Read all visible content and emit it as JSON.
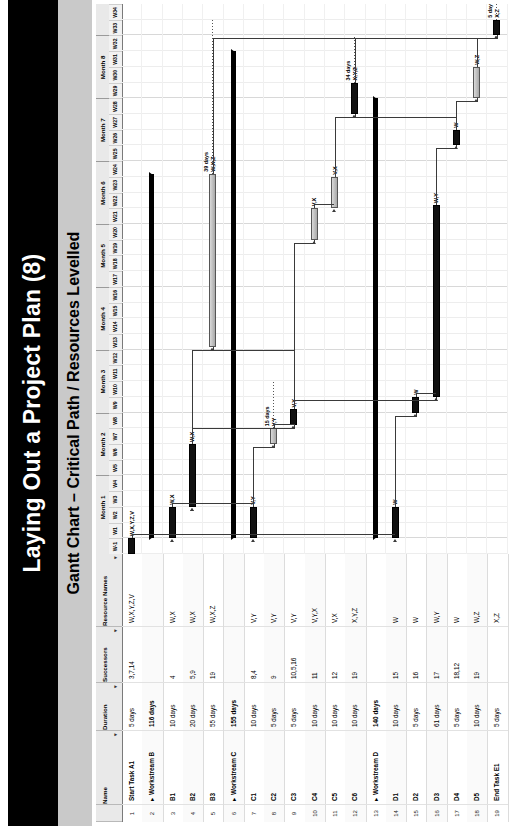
{
  "slide": {
    "title": "Laying Out a Project Plan (8)",
    "subtitle": "Gantt Chart – Critical Path / Resources Levelled"
  },
  "table": {
    "headers": {
      "num": "",
      "name": "Name",
      "duration": "Duration",
      "successors": "Successors",
      "resources": "Resource Names",
      "filter_caret": "▾"
    },
    "rows": [
      {
        "num": "1",
        "name": "Start Task A1",
        "duration": "5 days",
        "successors": "3,7,14",
        "resources": "W,X,Y,Z,V",
        "type": "task"
      },
      {
        "num": "2",
        "name": "Workstream B",
        "duration": "116 days",
        "successors": "",
        "resources": "",
        "type": "summary"
      },
      {
        "num": "3",
        "name": "B1",
        "duration": "10 days",
        "successors": "4",
        "resources": "W,X",
        "type": "task"
      },
      {
        "num": "4",
        "name": "B2",
        "duration": "20 days",
        "successors": "5,9",
        "resources": "W,X",
        "type": "task"
      },
      {
        "num": "5",
        "name": "B3",
        "duration": "55 days",
        "successors": "19",
        "resources": "W,X,Z",
        "type": "task"
      },
      {
        "num": "6",
        "name": "Workstream C",
        "duration": "155 days",
        "successors": "",
        "resources": "",
        "type": "summary"
      },
      {
        "num": "7",
        "name": "C1",
        "duration": "10 days",
        "successors": "8,4",
        "resources": "V,Y",
        "type": "task"
      },
      {
        "num": "8",
        "name": "C2",
        "duration": "5 days",
        "successors": "9",
        "resources": "V,Y",
        "type": "task"
      },
      {
        "num": "9",
        "name": "C3",
        "duration": "5 days",
        "successors": "10,5,16",
        "resources": "V,Y",
        "type": "task"
      },
      {
        "num": "10",
        "name": "C4",
        "duration": "10 days",
        "successors": "11",
        "resources": "V,Y,X",
        "type": "task"
      },
      {
        "num": "11",
        "name": "C5",
        "duration": "10 days",
        "successors": "12",
        "resources": "V,X",
        "type": "task"
      },
      {
        "num": "12",
        "name": "C6",
        "duration": "10 days",
        "successors": "19",
        "resources": "X,Y,Z",
        "type": "task"
      },
      {
        "num": "13",
        "name": "Workstream D",
        "duration": "140 days",
        "successors": "",
        "resources": "",
        "type": "summary"
      },
      {
        "num": "14",
        "name": "D1",
        "duration": "10 days",
        "successors": "15",
        "resources": "W",
        "type": "task"
      },
      {
        "num": "15",
        "name": "D2",
        "duration": "5 days",
        "successors": "16",
        "resources": "W",
        "type": "task"
      },
      {
        "num": "16",
        "name": "D3",
        "duration": "61 days",
        "successors": "17",
        "resources": "W,Y",
        "type": "task"
      },
      {
        "num": "17",
        "name": "D4",
        "duration": "5 days",
        "successors": "18,12",
        "resources": "W",
        "type": "task"
      },
      {
        "num": "18",
        "name": "D5",
        "duration": "10 days",
        "successors": "19",
        "resources": "W,Z",
        "type": "task"
      },
      {
        "num": "19",
        "name": "End Task E1",
        "duration": "5 days",
        "successors": "",
        "resources": "X,Z",
        "type": "task"
      }
    ]
  },
  "timeline": {
    "months": [
      "Month 1",
      "Month 2",
      "Month 3",
      "Month 4",
      "Month 5",
      "Month 6",
      "Month 7",
      "Month 8"
    ],
    "weeks": [
      "W-1",
      "W1",
      "W2",
      "W3",
      "W4",
      "W5",
      "W6",
      "W7",
      "W8",
      "W9",
      "W10",
      "W11",
      "W12",
      "W13",
      "W14",
      "W15",
      "W16",
      "W17",
      "W18",
      "W19",
      "W20",
      "W21",
      "W22",
      "W23",
      "W24",
      "W25",
      "W26",
      "W27",
      "W28",
      "W29",
      "W30",
      "W31",
      "W32",
      "W33",
      "W34"
    ],
    "week_count": 35,
    "weeks_per_month": 4
  },
  "chart_data": {
    "type": "bar",
    "title": "Gantt Chart – Critical Path / Resources Levelled",
    "xlabel": "",
    "ylabel": "",
    "x_unit": "week",
    "xlim": [
      0,
      35
    ],
    "grid": true,
    "legend": "none",
    "bars": [
      {
        "row": 1,
        "task": "Start Task A1",
        "start_week": 0,
        "duration_weeks": 1,
        "critical": true,
        "label": "W,X,Y,Z,V",
        "kind": "task"
      },
      {
        "row": 2,
        "task": "Workstream B",
        "start_week": 1,
        "duration_weeks": 23.2,
        "critical": false,
        "label": "",
        "kind": "summary"
      },
      {
        "row": 3,
        "task": "B1",
        "start_week": 1,
        "duration_weeks": 2,
        "critical": true,
        "label": "W,X",
        "kind": "task"
      },
      {
        "row": 4,
        "task": "B2",
        "start_week": 3,
        "duration_weeks": 4,
        "critical": true,
        "label": "W,X",
        "kind": "task"
      },
      {
        "row": 5,
        "task": "B3",
        "start_week": 13.2,
        "duration_weeks": 11,
        "critical": false,
        "label": "W,X,Z",
        "kind": "task",
        "slack_days": "39 days",
        "slack_to_week": 34
      },
      {
        "row": 6,
        "task": "Workstream C",
        "start_week": 1,
        "duration_weeks": 31,
        "critical": false,
        "label": "",
        "kind": "summary"
      },
      {
        "row": 7,
        "task": "C1",
        "start_week": 1,
        "duration_weeks": 2,
        "critical": true,
        "label": "V,Y",
        "kind": "task"
      },
      {
        "row": 8,
        "task": "C2",
        "start_week": 7,
        "duration_weeks": 1,
        "critical": false,
        "label": "V,Y",
        "kind": "task",
        "slack_days": "15 days"
      },
      {
        "row": 9,
        "task": "C3",
        "start_week": 8.2,
        "duration_weeks": 1,
        "critical": true,
        "label": "V,Y",
        "kind": "task"
      },
      {
        "row": 10,
        "task": "C4",
        "start_week": 20,
        "duration_weeks": 2,
        "critical": false,
        "label": "V,X",
        "kind": "task"
      },
      {
        "row": 11,
        "task": "C5",
        "start_week": 22,
        "duration_weeks": 2,
        "critical": false,
        "label": "V,X",
        "kind": "task"
      },
      {
        "row": 12,
        "task": "C6",
        "start_week": 28,
        "duration_weeks": 2,
        "critical": true,
        "label": "X,Y,Z",
        "kind": "task",
        "slack_days": "34 days"
      },
      {
        "row": 13,
        "task": "Workstream D",
        "start_week": 1,
        "duration_weeks": 28,
        "critical": false,
        "label": "",
        "kind": "summary"
      },
      {
        "row": 14,
        "task": "D1",
        "start_week": 1,
        "duration_weeks": 2,
        "critical": true,
        "label": "W",
        "kind": "task"
      },
      {
        "row": 15,
        "task": "D2",
        "start_week": 9,
        "duration_weeks": 1,
        "critical": true,
        "label": "W",
        "kind": "task"
      },
      {
        "row": 16,
        "task": "D3",
        "start_week": 10,
        "duration_weeks": 12.2,
        "critical": true,
        "label": "W,Y",
        "kind": "task"
      },
      {
        "row": 17,
        "task": "D4",
        "start_week": 26,
        "duration_weeks": 1,
        "critical": true,
        "label": "W",
        "kind": "task"
      },
      {
        "row": 18,
        "task": "D5",
        "start_week": 29,
        "duration_weeks": 2,
        "critical": false,
        "label": "W,Z",
        "kind": "task"
      },
      {
        "row": 19,
        "task": "End Task E1",
        "start_week": 33,
        "duration_weeks": 1,
        "critical": true,
        "label": "X,Z",
        "kind": "task",
        "slack_days": "5 days"
      }
    ],
    "annotations": [
      {
        "text": "39 days",
        "row": 5
      },
      {
        "text": "15 days",
        "row": 8
      },
      {
        "text": "34 days",
        "row": 12
      },
      {
        "text": "5 days",
        "row": 19
      }
    ]
  }
}
